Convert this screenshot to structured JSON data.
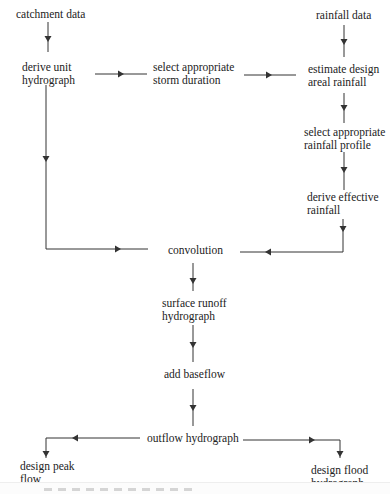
{
  "diagram": {
    "nodes": {
      "catchment_data": "catchment data",
      "derive_uh_1": "derive unit",
      "derive_uh_2": "hydrograph",
      "storm_1": "select appropriate",
      "storm_2": "storm duration",
      "rainfall_data": "rainfall data",
      "areal_1": "estimate design",
      "areal_2": "areal rainfall",
      "profile_1": "select appropriate",
      "profile_2": "rainfall profile",
      "effective_1": "derive effective",
      "effective_2": "rainfall",
      "convolution": "convolution",
      "runoff_1": "surface runoff",
      "runoff_2": "hydrograph",
      "baseflow": "add baseflow",
      "outflow": "outflow hydrograph",
      "peak_1": "design peak",
      "peak_2": "flow",
      "flood_1": "design flood",
      "flood_2": "hydrograph"
    },
    "edges": [
      [
        "catchment data",
        "derive unit hydrograph"
      ],
      [
        "derive unit hydrograph",
        "select appropriate storm duration"
      ],
      [
        "select appropriate storm duration",
        "estimate design areal rainfall"
      ],
      [
        "rainfall data",
        "estimate design areal rainfall"
      ],
      [
        "estimate design areal rainfall",
        "select appropriate rainfall profile"
      ],
      [
        "select appropriate rainfall profile",
        "derive effective rainfall"
      ],
      [
        "derive effective rainfall",
        "convolution"
      ],
      [
        "derive unit hydrograph",
        "convolution"
      ],
      [
        "convolution",
        "surface runoff hydrograph"
      ],
      [
        "surface runoff hydrograph",
        "add baseflow"
      ],
      [
        "add baseflow",
        "outflow hydrograph"
      ],
      [
        "outflow hydrograph",
        "design peak flow"
      ],
      [
        "outflow hydrograph",
        "design flood hydrograph"
      ]
    ],
    "line_color": "#333333"
  }
}
